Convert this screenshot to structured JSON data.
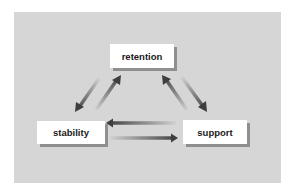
{
  "diagram": {
    "type": "cycle",
    "background_color": "#d6d6d6",
    "nodes": [
      {
        "id": "retention",
        "label": "retention"
      },
      {
        "id": "stability",
        "label": "stability"
      },
      {
        "id": "support",
        "label": "support"
      }
    ],
    "edges": [
      {
        "from": "retention",
        "to": "stability"
      },
      {
        "from": "stability",
        "to": "retention"
      },
      {
        "from": "support",
        "to": "retention"
      },
      {
        "from": "retention",
        "to": "support"
      },
      {
        "from": "support",
        "to": "stability"
      },
      {
        "from": "stability",
        "to": "support"
      }
    ],
    "arrow_color": "#4a4a4a"
  }
}
